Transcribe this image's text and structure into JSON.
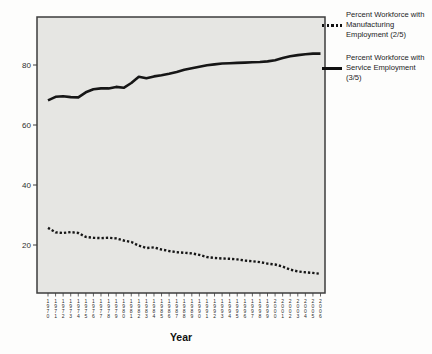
{
  "chart_data": {
    "type": "line",
    "title": "",
    "xlabel": "Year",
    "ylabel": "",
    "x": [
      1970,
      1971,
      1972,
      1973,
      1974,
      1975,
      1976,
      1977,
      1978,
      1979,
      1980,
      1981,
      1982,
      1983,
      1984,
      1985,
      1986,
      1987,
      1988,
      1989,
      1990,
      1991,
      1992,
      1993,
      1994,
      1995,
      1996,
      1997,
      1998,
      1999,
      2000,
      2001,
      2002,
      2003,
      2004,
      2005,
      2006
    ],
    "yticks": [
      20,
      40,
      60,
      80
    ],
    "ylim": [
      4,
      96
    ],
    "grid": false,
    "legend_position": "right",
    "series": [
      {
        "name": "Percent Workforce with Manufacturing Employment (2/5)",
        "line_style": "dotted",
        "values": [
          25.7,
          24.2,
          24.0,
          24.3,
          24.0,
          22.7,
          22.4,
          22.3,
          22.4,
          22.2,
          21.5,
          21.0,
          19.8,
          19.0,
          19.2,
          18.5,
          18.0,
          17.6,
          17.4,
          17.2,
          16.7,
          16.0,
          15.7,
          15.5,
          15.4,
          15.2,
          14.8,
          14.6,
          14.3,
          13.8,
          13.5,
          12.8,
          11.8,
          11.2,
          10.9,
          10.7,
          10.4
        ]
      },
      {
        "name": "Percent Workforce with Service Employment (3/5)",
        "line_style": "solid",
        "values": [
          68.2,
          69.4,
          69.6,
          69.3,
          69.2,
          70.9,
          71.9,
          72.2,
          72.2,
          72.7,
          72.4,
          74.0,
          76.1,
          75.6,
          76.2,
          76.6,
          77.1,
          77.7,
          78.4,
          78.9,
          79.4,
          79.9,
          80.2,
          80.5,
          80.6,
          80.7,
          80.8,
          80.9,
          81.0,
          81.2,
          81.6,
          82.3,
          82.9,
          83.3,
          83.6,
          83.8,
          83.8
        ]
      }
    ]
  },
  "axis": {
    "x_title": "Year"
  },
  "colors": {
    "line": "#161616",
    "plot_bg": "#e6e6e3",
    "frame": "#3c3c3c",
    "tick": "#3c3c3c",
    "text": "#1c1c1c"
  }
}
